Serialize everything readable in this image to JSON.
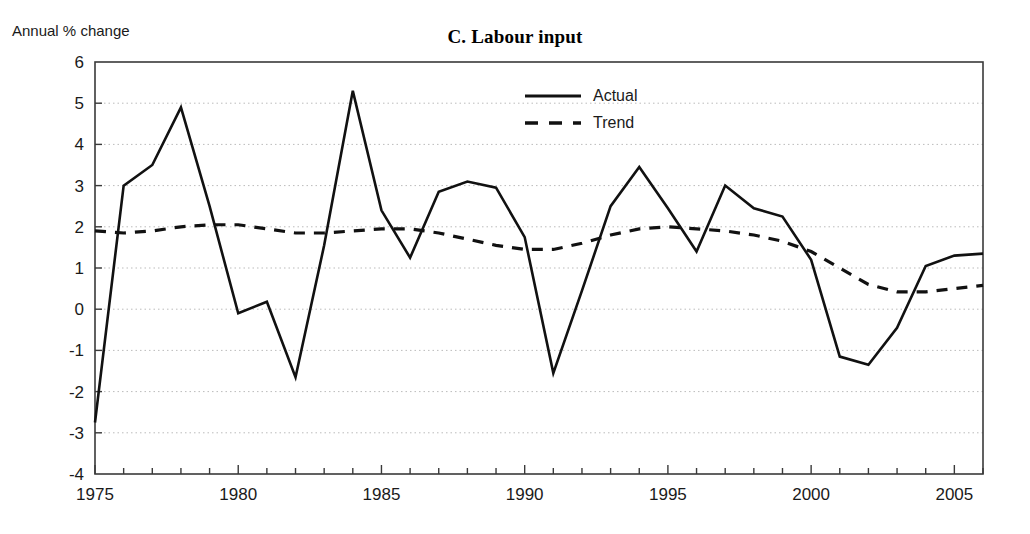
{
  "chart_data": {
    "type": "line",
    "title": "C. Labour input",
    "ylabel": "Annual % change",
    "xlabel": "",
    "xlim": [
      1975,
      2006
    ],
    "ylim": [
      -4,
      6
    ],
    "ytick_step": 1,
    "xtick_step": 5,
    "xtick_minor_step": 1,
    "grid": "horizontal-dotted",
    "legend_position": "top-center",
    "x": [
      1975,
      1976,
      1977,
      1978,
      1979,
      1980,
      1981,
      1982,
      1983,
      1984,
      1985,
      1986,
      1987,
      1988,
      1989,
      1990,
      1991,
      1992,
      1993,
      1994,
      1995,
      1996,
      1997,
      1998,
      1999,
      2000,
      2001,
      2002,
      2003,
      2004,
      2005,
      2006
    ],
    "series": [
      {
        "name": "Actual",
        "style": "solid",
        "color": "#111111",
        "values": [
          -2.75,
          3.0,
          3.5,
          4.9,
          2.5,
          -0.1,
          0.18,
          -1.65,
          1.55,
          5.3,
          2.4,
          1.25,
          2.85,
          3.1,
          2.95,
          1.75,
          -1.55,
          0.45,
          2.5,
          3.45,
          2.45,
          1.4,
          3.0,
          2.45,
          2.25,
          1.2,
          -1.15,
          -1.35,
          -0.45,
          1.05,
          1.3,
          1.35
        ]
      },
      {
        "name": "Trend",
        "style": "dashed",
        "color": "#111111",
        "values": [
          1.9,
          1.85,
          1.9,
          2.0,
          2.05,
          2.05,
          1.95,
          1.85,
          1.85,
          1.9,
          1.95,
          1.95,
          1.85,
          1.7,
          1.55,
          1.45,
          1.45,
          1.6,
          1.8,
          1.95,
          2.0,
          1.95,
          1.9,
          1.8,
          1.65,
          1.4,
          1.0,
          0.6,
          0.42,
          0.42,
          0.5,
          0.58
        ]
      }
    ],
    "xticklabels": [
      "1975",
      "1980",
      "1985",
      "1990",
      "1995",
      "2000",
      "2005"
    ],
    "xticks": [
      1975,
      1980,
      1985,
      1990,
      1995,
      2000,
      2005
    ],
    "yticklabels": [
      "6",
      "5",
      "4",
      "3",
      "2",
      "1",
      "0",
      "-1",
      "-2",
      "-3",
      "-4"
    ],
    "yticks": [
      6,
      5,
      4,
      3,
      2,
      1,
      0,
      -1,
      -2,
      -3,
      -4
    ]
  },
  "legend": {
    "items": [
      {
        "label": "Actual",
        "style": "solid"
      },
      {
        "label": "Trend",
        "style": "dashed"
      }
    ]
  }
}
